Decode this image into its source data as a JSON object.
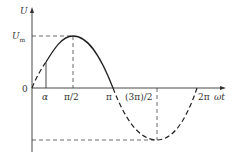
{
  "diagram": {
    "type": "sine-waveform",
    "axes": {
      "y_label": "U",
      "x_label": "ωt",
      "origin_label": "0"
    },
    "amplitude_label": "Um",
    "amplitude_label_main": "U",
    "amplitude_label_sub": "m",
    "x_ticks": [
      {
        "label": "α",
        "x": 46
      },
      {
        "label": "π/2",
        "x": 73
      },
      {
        "label": "π",
        "x": 113
      },
      {
        "label": "(3π)/2",
        "x": 157
      },
      {
        "label": "2π",
        "x": 197
      }
    ],
    "curve": {
      "solid_segment": "from α to π (positive half, conducting)",
      "dashed_segment": "0 to α and π to 2π"
    },
    "colors": {
      "line": "#222222",
      "background": "#ffffff"
    }
  }
}
